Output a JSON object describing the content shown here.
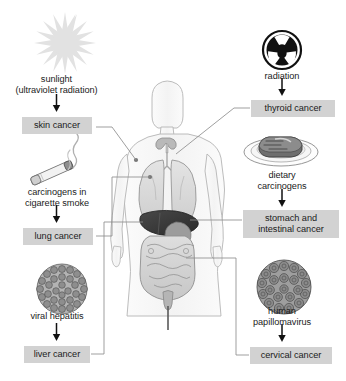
{
  "diagram": {
    "background_color": "#ffffff",
    "chip_color": "#d2d2d2",
    "text_color": "#1b1b1b",
    "line_color": "#808080"
  },
  "left_column": {
    "sunlight": {
      "icon": "sun-starburst-icon",
      "line1": "sunlight",
      "line2": "(ultraviolet radiation)",
      "arrow": "↓",
      "outcome": "skin cancer"
    },
    "cigarette": {
      "icon": "cigarette-smoke-icon",
      "line1": "carcinogens in",
      "line2": "cigarette smoke",
      "arrow": "↓",
      "outcome": "lung cancer"
    },
    "hepatitis": {
      "icon": "hepatitis-virus-icon",
      "line1": "viral hepatitis",
      "arrow": "↓",
      "outcome": "liver cancer"
    }
  },
  "right_column": {
    "radiation": {
      "icon": "radiation-trefoil-icon",
      "line1": "radiation",
      "arrow": "↓",
      "outcome": "thyroid cancer"
    },
    "diet": {
      "icon": "steak-on-plate-icon",
      "line1": "dietary",
      "line2": "carcinogens",
      "arrow": "↓",
      "outcome_line1": "stomach and",
      "outcome_line2": "intestinal cancer"
    },
    "hpv": {
      "icon": "papillomavirus-icon",
      "line1": "human",
      "line2": "papillomavirus",
      "arrow": "↓",
      "outcome": "cervical cancer"
    }
  },
  "body_figure": {
    "name": "human-body-anatomy-illustration",
    "organs": [
      "thyroid",
      "lungs",
      "liver",
      "stomach",
      "intestines",
      "cervix"
    ]
  },
  "connectors": [
    {
      "from": "skin cancer",
      "to": "shoulder-skin"
    },
    {
      "from": "lung cancer",
      "to": "lungs"
    },
    {
      "from": "liver cancer",
      "to": "liver"
    },
    {
      "from": "thyroid cancer",
      "to": "thyroid"
    },
    {
      "from": "stomach and intestinal cancer",
      "to": "stomach"
    },
    {
      "from": "cervical cancer",
      "to": "cervix"
    }
  ]
}
